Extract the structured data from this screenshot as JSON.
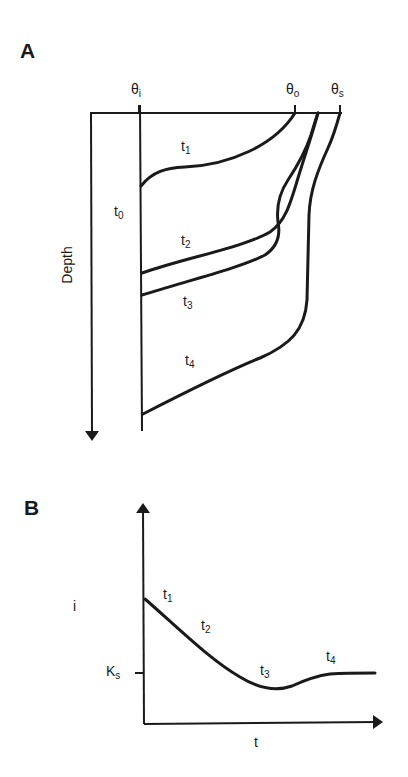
{
  "panel_a": {
    "letter": "A",
    "axis_labels": {
      "theta_i": {
        "base": "θ",
        "sub": "i"
      },
      "theta_o": {
        "base": "θ",
        "sub": "o"
      },
      "theta_s": {
        "base": "θ",
        "sub": "s"
      },
      "depth": "Depth"
    },
    "curve_labels": [
      {
        "id": "t0",
        "base": "t",
        "sub": "0"
      },
      {
        "id": "t1",
        "base": "t",
        "sub": "1"
      },
      {
        "id": "t2",
        "base": "t",
        "sub": "2"
      },
      {
        "id": "t3",
        "base": "t",
        "sub": "3"
      },
      {
        "id": "t4",
        "base": "t",
        "sub": "4"
      }
    ]
  },
  "panel_b": {
    "letter": "B",
    "y_axis_label": "i",
    "x_axis_label": "t",
    "tick_label": {
      "base": "K",
      "sub": "s"
    },
    "curve_labels": [
      {
        "id": "t1",
        "base": "t",
        "sub": "1"
      },
      {
        "id": "t2",
        "base": "t",
        "sub": "2"
      },
      {
        "id": "t3",
        "base": "t",
        "sub": "3"
      },
      {
        "id": "t4",
        "base": "t",
        "sub": "4"
      }
    ]
  },
  "colors": {
    "ink": "#1a1a1a",
    "background": "#ffffff"
  }
}
